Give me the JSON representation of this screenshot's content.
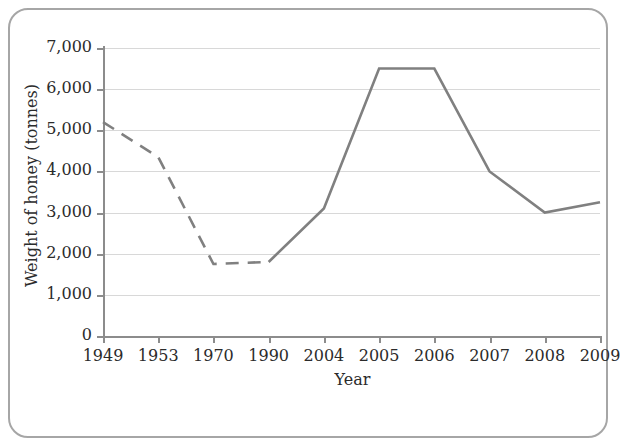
{
  "chart_data": {
    "type": "line",
    "title": "",
    "xlabel": "Year",
    "ylabel": "Weight of honey (tonnes)",
    "categories": [
      "1949",
      "1953",
      "1970",
      "1990",
      "2004",
      "2005",
      "2006",
      "2007",
      "2008",
      "2009"
    ],
    "values": [
      5200,
      4350,
      1750,
      1800,
      3100,
      6500,
      6500,
      4000,
      3000,
      3250
    ],
    "series": [
      {
        "name": "Weight of honey",
        "values": [
          5200,
          4350,
          1750,
          1800,
          3100,
          6500,
          6500,
          4000,
          3000,
          3250
        ]
      }
    ],
    "ylim": [
      0,
      7000
    ],
    "ytick_labels": [
      "0",
      "1,000",
      "2,000",
      "3,000",
      "4,000",
      "5,000",
      "6,000",
      "7,000"
    ],
    "ytick_values": [
      0,
      1000,
      2000,
      3000,
      4000,
      5000,
      6000,
      7000
    ],
    "grid": "horizontal",
    "legend": "none",
    "line_color": "#808080",
    "gridline_color": "#d8d8d8",
    "axis_color": "#8c8c8c",
    "line_styles": [
      {
        "from_index": 0,
        "to_index": 3,
        "style": "dashed"
      },
      {
        "from_index": 3,
        "to_index": 9,
        "style": "solid"
      }
    ]
  }
}
